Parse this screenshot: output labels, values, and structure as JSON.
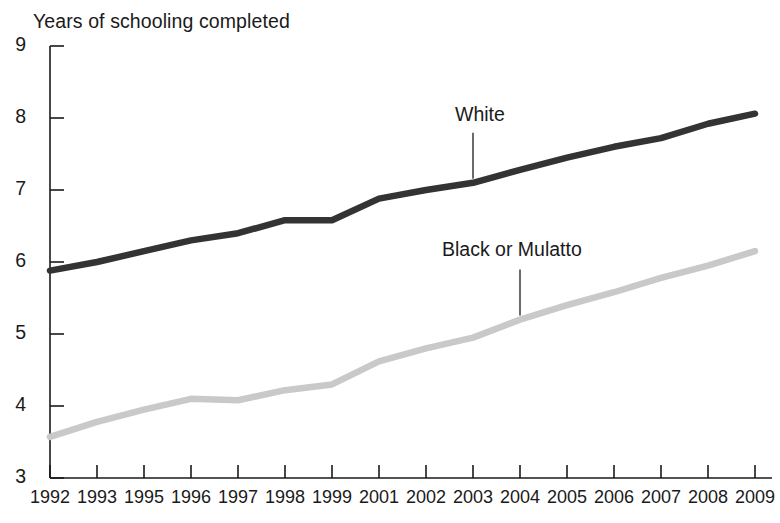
{
  "chart_data": {
    "type": "line",
    "title": "Years of schooling completed",
    "xlabel": "",
    "ylabel": "Years of schooling completed",
    "ylim": [
      3,
      9
    ],
    "yticks": [
      3,
      4,
      5,
      6,
      7,
      8,
      9
    ],
    "grid": false,
    "legend_position": "inline-annotation",
    "categories": [
      "1992",
      "1993",
      "1995",
      "1996",
      "1997",
      "1998",
      "1999",
      "2001",
      "2002",
      "2003",
      "2004",
      "2005",
      "2006",
      "2007",
      "2008",
      "2009"
    ],
    "series": [
      {
        "name": "White",
        "color": "#333333",
        "values": [
          5.88,
          6.0,
          6.15,
          6.3,
          6.4,
          6.58,
          6.58,
          6.88,
          7.0,
          7.1,
          7.28,
          7.45,
          7.6,
          7.72,
          7.92,
          8.06
        ]
      },
      {
        "name": "Black or Mulatto",
        "color": "#c9c9c9",
        "values": [
          3.57,
          3.78,
          3.95,
          4.1,
          4.08,
          4.22,
          4.3,
          4.62,
          4.8,
          4.95,
          5.2,
          5.4,
          5.58,
          5.78,
          5.95,
          6.15
        ]
      }
    ],
    "annotations": [
      {
        "text": "White",
        "series": "White",
        "anchor_category": "2003"
      },
      {
        "text": "Black or Mulatto",
        "series": "Black or Mulatto",
        "anchor_category": "2004"
      }
    ]
  }
}
